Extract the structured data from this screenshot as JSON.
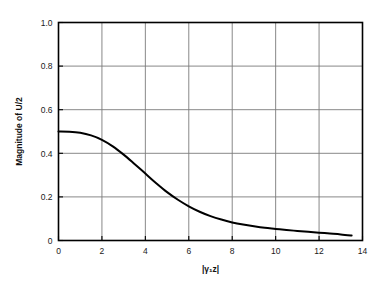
{
  "chart_data": {
    "type": "line",
    "title": "",
    "subtitle": "",
    "xlabel": "|γ₁z|",
    "ylabel": "Magnitude of U/2",
    "xlim": [
      0,
      14
    ],
    "ylim": [
      0,
      1.0
    ],
    "grid": true,
    "legend": null,
    "xticks": [
      "0",
      "2",
      "4",
      "6",
      "8",
      "10",
      "12",
      "14"
    ],
    "xtick_values": [
      0,
      2,
      4,
      6,
      8,
      10,
      12,
      14
    ],
    "yticks": [
      "0",
      "0.2",
      "0.4",
      "0.6",
      "0.8",
      "1.0"
    ],
    "ytick_values": [
      0,
      0.2,
      0.4,
      0.6,
      0.8,
      1.0
    ],
    "series": [
      {
        "name": "Magnitude of U/2",
        "color": "#000000",
        "x": [
          0,
          0.5,
          1.0,
          1.5,
          2.0,
          2.5,
          3.0,
          3.5,
          4.0,
          4.5,
          5.0,
          5.5,
          6.0,
          6.5,
          7.0,
          7.5,
          8.0,
          8.5,
          9.0,
          9.5,
          10.0,
          10.5,
          11.0,
          11.5,
          12.0,
          12.5,
          13.0,
          13.5
        ],
        "y": [
          0.5,
          0.499,
          0.494,
          0.482,
          0.462,
          0.432,
          0.394,
          0.351,
          0.307,
          0.263,
          0.222,
          0.187,
          0.157,
          0.132,
          0.112,
          0.096,
          0.083,
          0.073,
          0.065,
          0.058,
          0.053,
          0.048,
          0.044,
          0.04,
          0.036,
          0.032,
          0.028,
          0.023
        ]
      }
    ],
    "annotations": []
  },
  "figure": {
    "background_color": "#ffffff",
    "frame_color": "#000000",
    "grid_color": "#7a7a7a",
    "curve_color": "#000000"
  }
}
